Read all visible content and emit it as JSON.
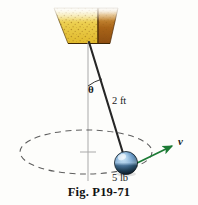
{
  "figure": {
    "caption": "Fig. P19-71",
    "background_color": "#fdfdfb",
    "width": 198,
    "height": 205
  },
  "labels": {
    "angle": "θ",
    "cord_length": "2 ft",
    "ball_weight": "5 lb",
    "velocity": "v"
  },
  "colors": {
    "support_left_face": "#e8c43c",
    "support_left_face_light": "#f3dd80",
    "support_right_face": "#b5731f",
    "support_right_face_dark": "#8a4f14",
    "support_speckle": "#8a5a10",
    "cord": "#2b2b2b",
    "axis_line": "#a8a8a8",
    "orbit_dash": "#6a6a6a",
    "ball_highlight": "#cfe4f5",
    "ball_mid": "#4f83b8",
    "ball_dark": "#16242e",
    "velocity_arrow": "#1b7a34",
    "text": "#1a1a1a"
  },
  "geometry": {
    "support": {
      "top_left_x": 54,
      "top_right_x": 118,
      "top_y": 8,
      "bottom_left_x": 68,
      "bottom_right_x": 110,
      "bottom_y": 43,
      "fold_x": 98
    },
    "pivot": {
      "x": 89,
      "y": 42
    },
    "ball": {
      "cx": 126,
      "cy": 163,
      "r": 11.5
    },
    "orbit_ellipse": {
      "cx": 86,
      "cy": 152,
      "rx": 66,
      "ry": 22
    },
    "vertical_axis": {
      "x": 88,
      "y_top": 42,
      "y_bottom": 181
    },
    "axis_tick": {
      "x1": 80,
      "x2": 96,
      "y": 152
    },
    "angle_arc": {
      "cx": 89,
      "cy": 42,
      "radius": 44
    },
    "velocity_arrow": {
      "x1": 134,
      "y1": 164,
      "x2": 174,
      "y2": 145
    }
  },
  "elements": {
    "support_name": "ceiling-support-bracket",
    "cord_name": "pendulum-cord",
    "ball_name": "pendulum-ball",
    "orbit_name": "circular-path-ellipse",
    "axis_name": "vertical-axis-line",
    "arc_name": "angle-arc",
    "arrow_name": "velocity-vector-arrow"
  }
}
